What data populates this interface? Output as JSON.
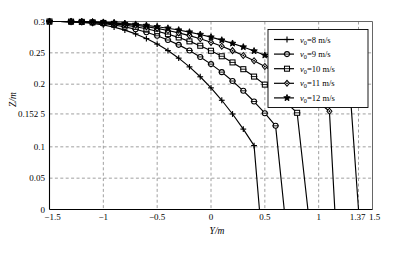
{
  "chart_data": {
    "type": "line",
    "title": "",
    "xlabel": "Y/m",
    "ylabel": "Z/m",
    "xlim": [
      -1.5,
      1.5
    ],
    "ylim": [
      0,
      0.3
    ],
    "grid": true,
    "legend_position": "top-right",
    "xticks": [
      -1.5,
      -1,
      -0.5,
      0,
      0.5,
      1,
      1.37,
      1.5
    ],
    "xtick_labels": [
      "-1.5",
      "-1",
      "-0.5",
      "0",
      "0.5",
      "1",
      "1.37",
      "1.5"
    ],
    "yticks": [
      0,
      0.05,
      0.1,
      0.1525,
      0.2,
      0.25,
      0.3
    ],
    "ytick_labels": [
      "0",
      "0.05",
      "0.1",
      "0.152 5",
      "0.2",
      "0.25",
      "0.3"
    ],
    "series": [
      {
        "name": "v0=8 m/s",
        "label_prefix": "v",
        "label_sub": "0",
        "label_suffix": "=8 m/s",
        "marker": "plus",
        "x": [
          -1.5,
          -1.4,
          -1.3,
          -1.2,
          -1.1,
          -1.0,
          -0.9,
          -0.8,
          -0.7,
          -0.6,
          -0.5,
          -0.4,
          -0.3,
          -0.2,
          -0.1,
          0.0,
          0.1,
          0.2,
          0.3,
          0.4,
          0.45
        ],
        "y": [
          0.3,
          0.3,
          0.2995,
          0.2985,
          0.297,
          0.2945,
          0.291,
          0.2862,
          0.2802,
          0.2728,
          0.264,
          0.2536,
          0.2415,
          0.2276,
          0.2118,
          0.1941,
          0.1743,
          0.1524,
          0.1283,
          0.102,
          0.0
        ]
      },
      {
        "name": "v0=9 m/s",
        "label_prefix": "v",
        "label_sub": "0",
        "label_suffix": "=9 m/s",
        "marker": "circle",
        "x": [
          -1.5,
          -1.4,
          -1.3,
          -1.2,
          -1.1,
          -1.0,
          -0.9,
          -0.8,
          -0.7,
          -0.6,
          -0.5,
          -0.4,
          -0.3,
          -0.2,
          -0.1,
          0.0,
          0.1,
          0.2,
          0.3,
          0.4,
          0.5,
          0.6,
          0.68
        ],
        "y": [
          0.3,
          0.3,
          0.2997,
          0.2991,
          0.2981,
          0.2966,
          0.2944,
          0.2914,
          0.2876,
          0.2829,
          0.2772,
          0.2705,
          0.2627,
          0.2537,
          0.2435,
          0.232,
          0.2192,
          0.205,
          0.1894,
          0.1723,
          0.1537,
          0.1335,
          0.0
        ]
      },
      {
        "name": "v0=10 m/s",
        "label_prefix": "v",
        "label_sub": "0",
        "label_suffix": "=10 m/s",
        "marker": "square",
        "x": [
          -1.5,
          -1.4,
          -1.3,
          -1.2,
          -1.1,
          -1.0,
          -0.9,
          -0.8,
          -0.7,
          -0.6,
          -0.5,
          -0.4,
          -0.3,
          -0.2,
          -0.1,
          0.0,
          0.1,
          0.2,
          0.3,
          0.4,
          0.5,
          0.6,
          0.7,
          0.8,
          0.9
        ],
        "y": [
          0.3,
          0.3,
          0.2998,
          0.2994,
          0.2987,
          0.2977,
          0.2962,
          0.2942,
          0.2916,
          0.2884,
          0.2845,
          0.2799,
          0.2745,
          0.2683,
          0.2613,
          0.2533,
          0.2445,
          0.2347,
          0.2239,
          0.2121,
          0.1993,
          0.1854,
          0.1704,
          0.1543,
          0.0
        ]
      },
      {
        "name": "v0=11 m/s",
        "label_prefix": "v",
        "label_sub": "0",
        "label_suffix": "=11 m/s",
        "marker": "diamond",
        "x": [
          -1.5,
          -1.4,
          -1.3,
          -1.2,
          -1.1,
          -1.0,
          -0.9,
          -0.8,
          -0.7,
          -0.6,
          -0.5,
          -0.4,
          -0.3,
          -0.2,
          -0.1,
          0.0,
          0.1,
          0.2,
          0.3,
          0.4,
          0.5,
          0.6,
          0.7,
          0.8,
          0.9,
          1.0,
          1.1,
          1.15
        ],
        "y": [
          0.3,
          0.3,
          0.2999,
          0.2996,
          0.2991,
          0.2983,
          0.2973,
          0.2958,
          0.294,
          0.2917,
          0.289,
          0.2857,
          0.2819,
          0.2775,
          0.2725,
          0.2668,
          0.2605,
          0.2535,
          0.2458,
          0.2374,
          0.2282,
          0.2183,
          0.2076,
          0.1961,
          0.1838,
          0.1707,
          0.1568,
          0.0
        ]
      },
      {
        "name": "v0=12 m/s",
        "label_prefix": "v",
        "label_sub": "0",
        "label_suffix": "=12 m/s",
        "marker": "star",
        "x": [
          -1.5,
          -1.4,
          -1.3,
          -1.2,
          -1.1,
          -1.0,
          -0.9,
          -0.8,
          -0.7,
          -0.6,
          -0.5,
          -0.4,
          -0.3,
          -0.2,
          -0.1,
          0.0,
          0.1,
          0.2,
          0.3,
          0.4,
          0.5,
          0.6,
          0.7,
          0.8,
          0.9,
          1.0,
          1.1,
          1.2,
          1.3,
          1.37
        ],
        "y": [
          0.3,
          0.3,
          0.2999,
          0.2997,
          0.2993,
          0.2987,
          0.298,
          0.2969,
          0.2955,
          0.2938,
          0.2917,
          0.2893,
          0.2864,
          0.2831,
          0.2793,
          0.2751,
          0.2703,
          0.2651,
          0.2593,
          0.253,
          0.2461,
          0.2386,
          0.2306,
          0.2219,
          0.2126,
          0.2027,
          0.1921,
          0.1809,
          0.169,
          0.0
        ]
      }
    ]
  }
}
